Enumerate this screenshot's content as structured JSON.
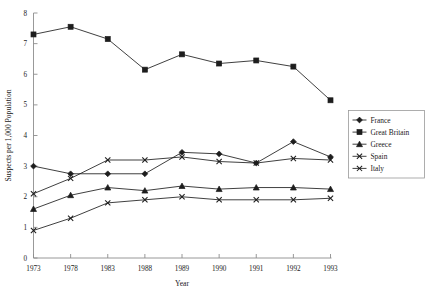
{
  "chart_data": {
    "type": "line",
    "title": "",
    "xlabel": "Year",
    "ylabel": "Suspects per 1,000 Population",
    "categories": [
      "1973",
      "1978",
      "1983",
      "1988",
      "1989",
      "1990",
      "1991",
      "1992",
      "1993"
    ],
    "xtick_labels": [
      "1973",
      "1978",
      "1983",
      "1988",
      "1989",
      "1990",
      "1991",
      "1992",
      "1993"
    ],
    "ytick_labels": [
      "0",
      "1",
      "2",
      "3",
      "4",
      "5",
      "6",
      "7",
      "8"
    ],
    "ytick_values": [
      0,
      1,
      2,
      3,
      4,
      5,
      6,
      7,
      8
    ],
    "ylim": [
      0,
      8
    ],
    "grid": false,
    "legend_position": "right",
    "series": [
      {
        "name": "France",
        "marker": "diamond",
        "color": "#1d1d1d",
        "values": [
          3.0,
          2.75,
          2.75,
          2.75,
          3.45,
          3.4,
          3.1,
          3.8,
          3.3
        ]
      },
      {
        "name": "Great Britain",
        "marker": "square",
        "color": "#1d1d1d",
        "values": [
          7.3,
          7.55,
          7.15,
          6.15,
          6.65,
          6.35,
          6.45,
          6.25,
          5.15
        ]
      },
      {
        "name": "Greece",
        "marker": "triangle",
        "color": "#1d1d1d",
        "values": [
          1.6,
          2.05,
          2.3,
          2.2,
          2.35,
          2.25,
          2.3,
          2.3,
          2.25
        ]
      },
      {
        "name": "Spain",
        "marker": "x",
        "color": "#1d1d1d",
        "values": [
          2.1,
          2.6,
          3.2,
          3.2,
          3.3,
          3.15,
          3.1,
          3.25,
          3.2
        ]
      },
      {
        "name": "Italy",
        "marker": "x",
        "color": "#1d1d1d",
        "values": [
          0.9,
          1.3,
          1.8,
          1.9,
          2.0,
          1.9,
          1.9,
          1.9,
          1.95
        ]
      }
    ]
  },
  "legend": {
    "entries": [
      {
        "label": "France"
      },
      {
        "label": "Great Britain"
      },
      {
        "label": "Greece"
      },
      {
        "label": "Spain"
      },
      {
        "label": "Italy"
      }
    ]
  }
}
